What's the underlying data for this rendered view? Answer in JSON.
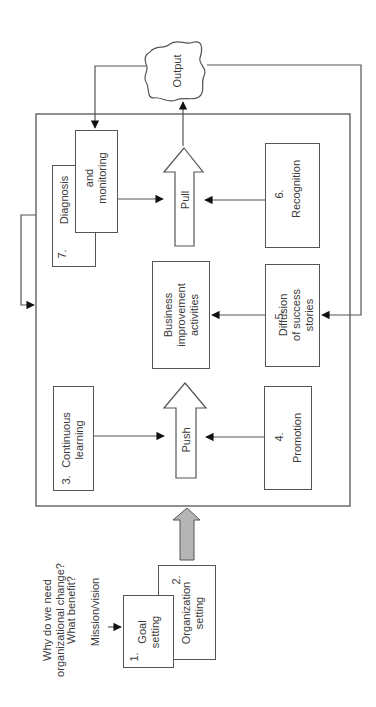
{
  "diagram": {
    "intro": {
      "question_line1": "Why do we need",
      "question_line2": "organizational change?",
      "benefit": "What benefit?",
      "mission": "Mission/vision"
    },
    "boxes": {
      "goal": {
        "number": "1.",
        "label": "Goal\nsetting"
      },
      "organization": {
        "number": "2.",
        "label": "Organization\nsetting"
      },
      "learning": {
        "number": "3.",
        "label": "Continuous\nlearning"
      },
      "promotion": {
        "number": "4.",
        "label": "Promotion"
      },
      "diffusion": {
        "number": "5.",
        "label": "Diffusion\nof success\nstories"
      },
      "recognition": {
        "number": "6.",
        "label": "Recognition"
      },
      "diagnosis": {
        "number": "7.",
        "label": "Diagnosis"
      },
      "monitoring": {
        "label": "and\nmonitoring"
      },
      "business": {
        "label": "Business\nimprovement\nactivities"
      }
    },
    "arrows": {
      "push": "Push",
      "pull": "Pull"
    },
    "output": "Output",
    "colors": {
      "line": "#555555",
      "gray_arrow": "#b5b5b5"
    }
  }
}
